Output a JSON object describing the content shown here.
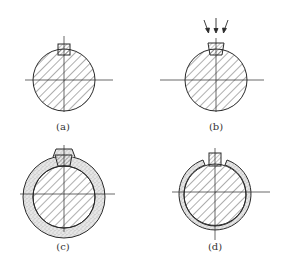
{
  "panels": [
    {
      "id": "a",
      "label": "(a)",
      "description": "shaft with square key",
      "cx": 64,
      "cy": 80
    },
    {
      "id": "b",
      "label": "(b)",
      "description": "shaft with tapered key and downward arrows",
      "cx": 216,
      "cy": 80
    },
    {
      "id": "c",
      "label": "(c)",
      "description": "shaft with thick stippled hub ring",
      "cx": 64,
      "cy": 197
    },
    {
      "id": "d",
      "label": "(d)",
      "description": "shaft with thin split stippled ring",
      "cx": 215,
      "cy": 195
    }
  ],
  "colors": {
    "line": "#2a2a2a",
    "hatch": "#333333",
    "stipple": "#d8d8d8",
    "background": "#ffffff"
  }
}
